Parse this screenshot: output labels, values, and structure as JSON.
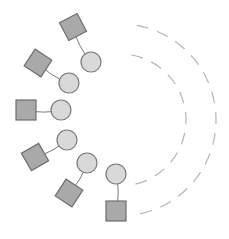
{
  "diagram": {
    "type": "radial-node-diagram",
    "colors": {
      "background": "#ffffff",
      "square_fill": "#a9a9a9",
      "square_stroke": "#6e6e6e",
      "circle_fill": "#d9d9d9",
      "circle_stroke": "#7a7a7a",
      "connector": "#7a7a7a",
      "dashed_arc": "#b5b5b5"
    },
    "arcs": [
      {
        "name": "outer-dashed-arc",
        "cx": 120,
        "cy": 120,
        "r": 96
      },
      {
        "name": "inner-dashed-arc",
        "cx": 120,
        "cy": 120,
        "r": 66
      }
    ],
    "pairs": [
      {
        "square": {
          "x": 73,
          "y": 27,
          "rot": -28
        },
        "circle": {
          "x": 91,
          "y": 62
        }
      },
      {
        "square": {
          "x": 38,
          "y": 63,
          "rot": 33
        },
        "circle": {
          "x": 69,
          "y": 83
        }
      },
      {
        "square": {
          "x": 26,
          "y": 110,
          "rot": 0
        },
        "circle": {
          "x": 61,
          "y": 110
        }
      },
      {
        "square": {
          "x": 35,
          "y": 157,
          "rot": -30
        },
        "circle": {
          "x": 67,
          "y": 140
        }
      },
      {
        "square": {
          "x": 69,
          "y": 193,
          "rot": 33
        },
        "circle": {
          "x": 87,
          "y": 163
        }
      },
      {
        "square": {
          "x": 116,
          "y": 211,
          "rot": 0
        },
        "circle": {
          "x": 116,
          "y": 174
        }
      }
    ],
    "square_size": 20,
    "circle_radius": 10
  }
}
